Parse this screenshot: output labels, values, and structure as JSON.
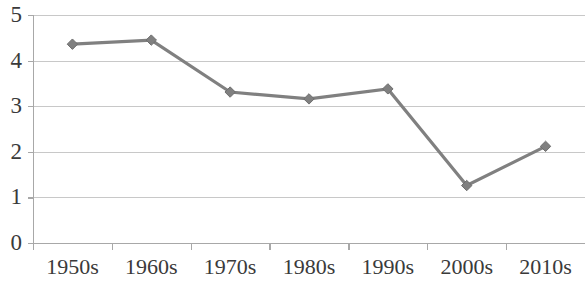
{
  "chart_data": {
    "type": "line",
    "title": "",
    "subtitle": "",
    "xlabel": "",
    "ylabel": "",
    "categories": [
      "1950s",
      "1960s",
      "1970s",
      "1980s",
      "1990s",
      "2000s",
      "2010s"
    ],
    "values": [
      4.36,
      4.45,
      3.31,
      3.16,
      3.38,
      1.26,
      2.12
    ],
    "series": [
      {
        "name": "",
        "values": [
          4.36,
          4.45,
          3.31,
          3.16,
          3.38,
          1.26,
          2.12
        ]
      }
    ],
    "ylim": [
      0,
      5
    ],
    "ytick_labels": [
      "5",
      "4",
      "3",
      "2",
      "1",
      "0"
    ],
    "ytick_values": [
      5,
      4,
      3,
      2,
      1,
      0
    ],
    "grid": true,
    "grid_axis": "y",
    "legend": false,
    "legend_position": "none",
    "marker": "diamond",
    "series_color": "#808080",
    "grid_color": "#c8c8c8",
    "axis_color": "#a8a8a8",
    "text_color": "#3a3a3a",
    "background_color": "#ffffff",
    "annotations": []
  },
  "axes": {
    "y_labels": [
      {
        "text": "5",
        "value": 5
      },
      {
        "text": "4",
        "value": 4
      },
      {
        "text": "3",
        "value": 3
      },
      {
        "text": "2",
        "value": 2
      },
      {
        "text": "1",
        "value": 1
      },
      {
        "text": "0",
        "value": 0
      }
    ],
    "x_labels": [
      {
        "text": "1950s"
      },
      {
        "text": "1960s"
      },
      {
        "text": "1970s"
      },
      {
        "text": "1980s"
      },
      {
        "text": "1990s"
      },
      {
        "text": "2000s"
      },
      {
        "text": "2010s"
      }
    ]
  }
}
